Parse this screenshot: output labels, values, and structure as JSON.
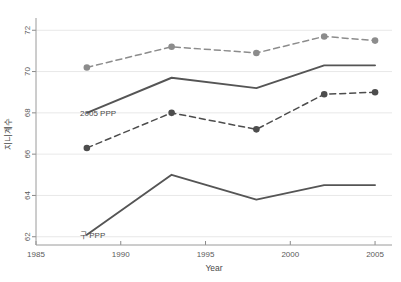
{
  "chart_data": {
    "type": "line",
    "title": "",
    "xlabel": "Year",
    "ylabel": "지니계수",
    "xlim": [
      1985,
      2006
    ],
    "ylim": [
      61.6,
      72.4
    ],
    "xticks": [
      1985,
      1990,
      1995,
      2000,
      2005
    ],
    "yticks": [
      62,
      64,
      66,
      68,
      70,
      72
    ],
    "grid": true,
    "legend": "none",
    "annotations": [
      {
        "text": "2005 PPP",
        "x": 1987.6,
        "y": 68.0
      },
      {
        "text": "구 PPP",
        "x": 1987.6,
        "y": 62.1
      }
    ],
    "x": [
      1988,
      1993,
      1998,
      2002,
      2005
    ],
    "series": [
      {
        "name": "2005 PPP upper",
        "style": "dashed",
        "markers": true,
        "color": "#8c8c8c",
        "values": [
          70.2,
          71.2,
          70.9,
          71.7,
          71.5
        ]
      },
      {
        "name": "2005 PPP lower",
        "style": "dashed",
        "markers": true,
        "color": "#4d4d4d",
        "values": [
          66.3,
          68.0,
          67.2,
          68.9,
          69.0
        ]
      },
      {
        "name": "2005 PPP mean",
        "style": "solid",
        "markers": false,
        "color": "#555555",
        "values": [
          68.0,
          69.7,
          69.2,
          70.3,
          70.3
        ]
      },
      {
        "name": "구 PPP mean",
        "style": "solid",
        "markers": false,
        "color": "#555555",
        "values": [
          62.1,
          65.0,
          63.8,
          64.5,
          64.5
        ]
      }
    ]
  },
  "axis": {
    "x_tick_labels": [
      "1985",
      "1990",
      "1995",
      "2000",
      "2005"
    ],
    "y_tick_labels": [
      "62",
      "64",
      "66",
      "68",
      "70",
      "72"
    ],
    "x_title": "Year",
    "y_title": "지니계수"
  },
  "labels": {
    "ann_2005ppp": "2005 PPP",
    "ann_oldppp": "구 PPP"
  }
}
